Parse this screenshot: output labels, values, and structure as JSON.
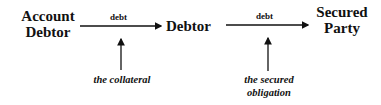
{
  "nodes": {
    "account_debtor": {
      "line1": "Account",
      "line2": "Debtor"
    },
    "debtor": {
      "label": "Debtor"
    },
    "secured_party": {
      "line1": "Secured",
      "line2": "Party"
    }
  },
  "edges": [
    {
      "from": "Account Debtor",
      "to": "Debtor",
      "label": "debt"
    },
    {
      "from": "Debtor",
      "to": "Secured Party",
      "label": "debt"
    }
  ],
  "annotations": {
    "collateral": "the collateral",
    "secured_obligation": {
      "line1": "the secured",
      "line2": "obligation"
    }
  },
  "colors": {
    "ink": "#111111",
    "background": "#ffffff"
  }
}
